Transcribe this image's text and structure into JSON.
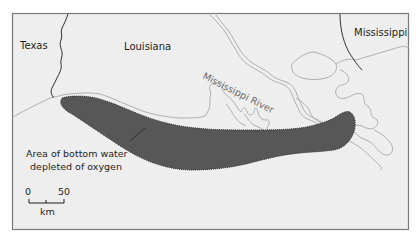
{
  "map": {
    "labels": {
      "texas": "Texas",
      "louisiana": "Louisiana",
      "mississippi": "Mississippi",
      "river": "Mississippi River"
    },
    "legend": {
      "line1": "Area of bottom water",
      "line2": "depleted of oxygen"
    },
    "scale": {
      "min": "0",
      "max": "50",
      "unit": "km"
    },
    "colors": {
      "background": "#eeeeee",
      "land_outline": "#a8a8a8",
      "hypoxic_zone": "#575757",
      "border": "#1e1e1e",
      "frame": "#7a7a7a"
    },
    "caption_fragment": "ll ..........  ,l,l,l,l,l ... ."
  }
}
